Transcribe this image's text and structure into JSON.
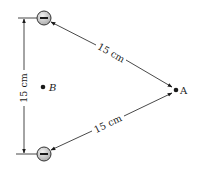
{
  "diagram": {
    "title": "",
    "charges": [
      {
        "id": "top",
        "sign": "-",
        "symbol": "minus"
      },
      {
        "id": "bottom",
        "sign": "-",
        "symbol": "minus"
      }
    ],
    "points": {
      "A": {
        "label": "A"
      },
      "B": {
        "label": "B"
      }
    },
    "dimensions": {
      "top_to_A": "15 cm",
      "bottom_to_A": "15 cm",
      "top_to_bottom": "15 cm"
    },
    "colors": {
      "line": "#1a1a1a",
      "charge_fill": "#d9d9d9",
      "charge_stroke": "#333333"
    }
  }
}
